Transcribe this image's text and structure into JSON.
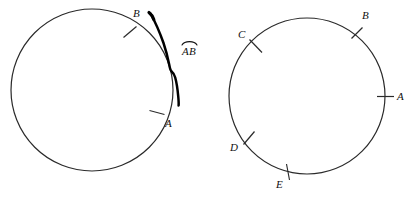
{
  "figure": {
    "background_color": "#ffffff",
    "stroke_color": "#222222",
    "highlight_color": "#000000",
    "width": 419,
    "height": 198
  },
  "left_diagram": {
    "name": "circle-with-highlighted-arc",
    "circle": {
      "cx": 92,
      "cy": 90,
      "r": 81
    },
    "points": [
      {
        "label": "B",
        "tick_x": 130,
        "tick_y": 32,
        "label_x": 133,
        "label_y": 8,
        "angle_deg": 298
      },
      {
        "label": "A",
        "tick_x": 157,
        "tick_y": 113,
        "label_x": 165,
        "label_y": 118,
        "angle_deg": 17
      }
    ],
    "highlight": {
      "name": "arc-ab-highlight",
      "from": "B",
      "to": "A"
    },
    "notation": {
      "letters": "AB",
      "symbol": "arc-bar",
      "x": 181,
      "y": 40
    }
  },
  "right_diagram": {
    "name": "circle-with-five-points",
    "circle": {
      "cx": 307,
      "cy": 96,
      "r": 78
    },
    "points": [
      {
        "label": "B",
        "tick_x": 357,
        "tick_y": 33,
        "label_x": 362,
        "label_y": 10,
        "angle_deg": 321
      },
      {
        "label": "A",
        "tick_x": 385,
        "tick_y": 96,
        "label_x": 396,
        "label_y": 92,
        "angle_deg": 0
      },
      {
        "label": "C",
        "tick_x": 256,
        "tick_y": 46,
        "label_x": 238,
        "label_y": 29,
        "angle_deg": 220
      },
      {
        "label": "D",
        "tick_x": 249,
        "tick_y": 138,
        "label_x": 230,
        "label_y": 142,
        "angle_deg": 147
      },
      {
        "label": "E",
        "tick_x": 287,
        "tick_y": 172,
        "label_x": 276,
        "label_y": 179,
        "angle_deg": 105
      }
    ]
  }
}
